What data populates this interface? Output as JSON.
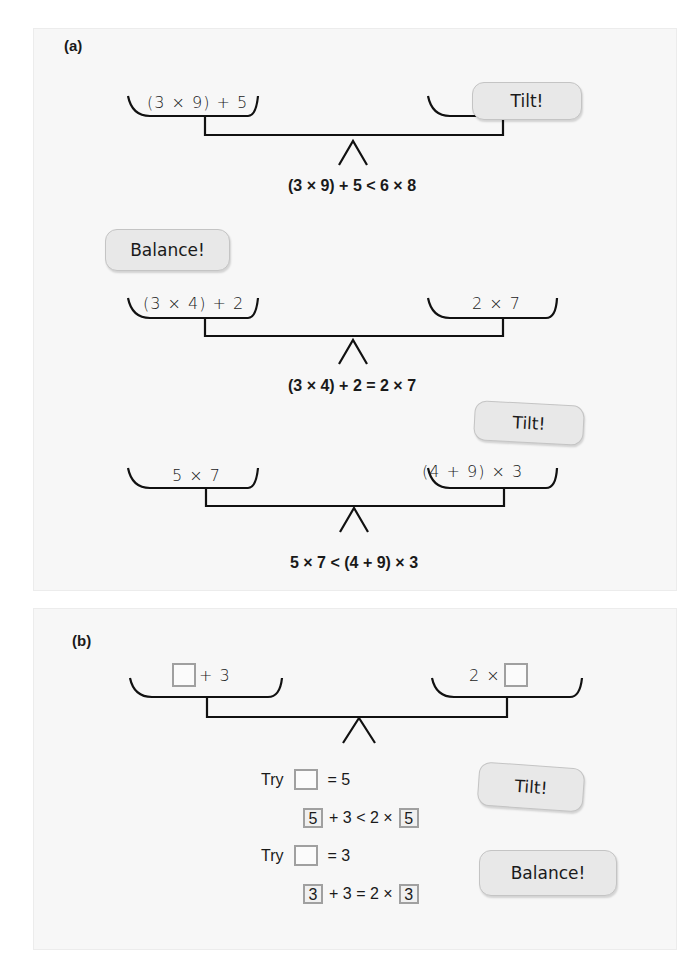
{
  "panel_a": {
    "label": "(a)",
    "scales": [
      {
        "left_expr": "(3 × 9) + 5",
        "right_expr": "6 × 8",
        "caption": "(3 × 9) + 5 < 6 × 8",
        "bubble": "Tilt!"
      },
      {
        "left_expr": "(3 × 4) + 2",
        "right_expr": "2 × 7",
        "caption": "(3 × 4) + 2 = 2 × 7",
        "bubble": "Balance!"
      },
      {
        "left_expr": "5 × 7",
        "right_expr": "(4 + 9) × 3",
        "caption": "5 × 7 < (4 + 9) × 3",
        "bubble": "Tilt!"
      }
    ]
  },
  "panel_b": {
    "label": "(b)",
    "left_expr_suffix": "+ 3",
    "right_expr_prefix": "2 ×",
    "trials": [
      {
        "try_label": "Try",
        "equals_text": "= 5",
        "value": "5",
        "middle": "+ 3 < 2 ×",
        "bubble": "Tilt!"
      },
      {
        "try_label": "Try",
        "equals_text": "= 3",
        "value": "3",
        "middle": "+ 3 = 2 ×",
        "bubble": "Balance!"
      }
    ]
  },
  "colors": {
    "panel_bg": "#f7f7f7",
    "bubble_bg": "#e8e8e8",
    "box_border": "#a0a0a0",
    "ink": "#1a1a1a"
  }
}
